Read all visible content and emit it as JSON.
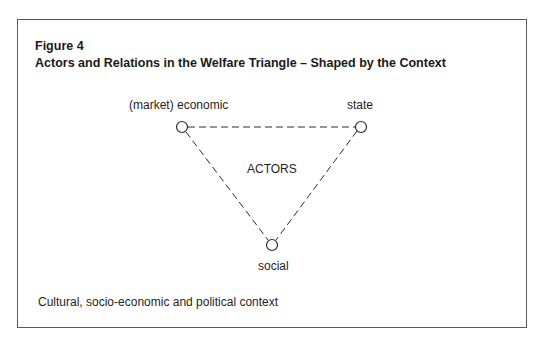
{
  "figure": {
    "label": "Figure 4",
    "title": "Actors and Relations in the Welfare Triangle – Shaped by the Context"
  },
  "diagram": {
    "nodes": [
      {
        "id": "economic",
        "label": "(market) economic"
      },
      {
        "id": "state",
        "label": "state"
      },
      {
        "id": "social",
        "label": "social"
      }
    ],
    "center_label": "ACTORS",
    "edges": [
      {
        "from": "economic",
        "to": "state",
        "style": "dashed"
      },
      {
        "from": "economic",
        "to": "social",
        "style": "dashed"
      },
      {
        "from": "state",
        "to": "social",
        "style": "dashed"
      }
    ],
    "context_label": "Cultural, socio-economic and political context"
  },
  "colors": {
    "line": "#2a2a2a",
    "border": "#5a5a5a",
    "text": "#1a1a1a"
  }
}
